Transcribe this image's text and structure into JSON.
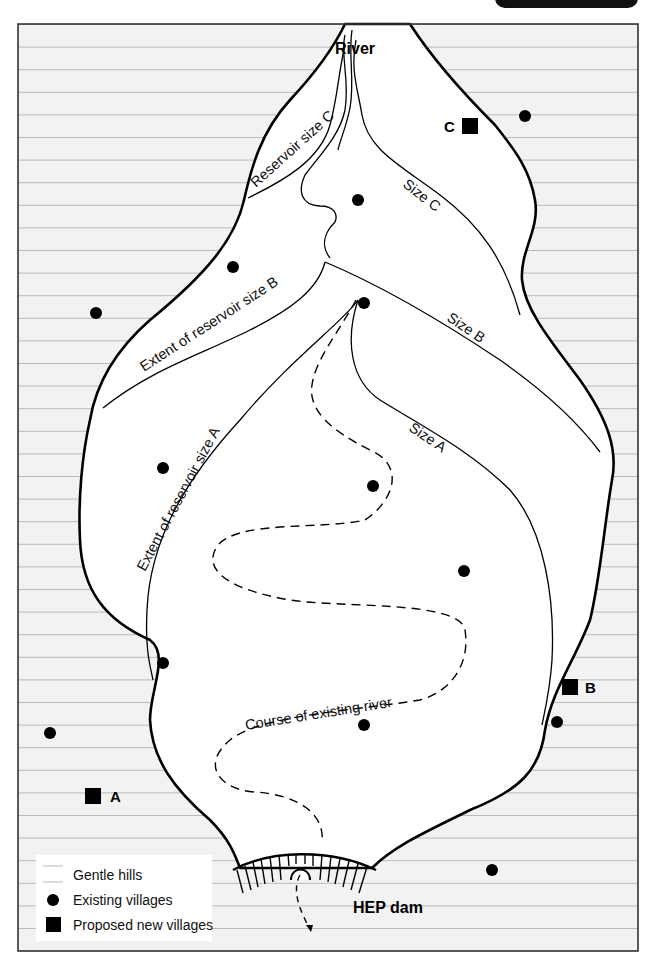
{
  "header_tab": {
    "text": ""
  },
  "map": {
    "labels": {
      "river": "River",
      "reservoir_size_c": "Reservoir size C",
      "size_c": "Size C",
      "extent_size_b": "Extent of reservoir size B",
      "size_b": "Size B",
      "extent_size_a": "Extent of reservoir size A",
      "size_a": "Size A",
      "course_existing_river": "Course of existing river",
      "hep_dam": "HEP dam"
    },
    "proposed_villages": [
      {
        "label": "A",
        "x": 93,
        "y": 796
      },
      {
        "label": "B",
        "x": 570,
        "y": 687
      },
      {
        "label": "C",
        "x": 470,
        "y": 126
      }
    ],
    "existing_villages": [
      {
        "x": 525,
        "y": 116
      },
      {
        "x": 358,
        "y": 200
      },
      {
        "x": 233,
        "y": 267
      },
      {
        "x": 96,
        "y": 313
      },
      {
        "x": 364,
        "y": 303
      },
      {
        "x": 163,
        "y": 468
      },
      {
        "x": 373,
        "y": 486
      },
      {
        "x": 464,
        "y": 571
      },
      {
        "x": 163,
        "y": 663
      },
      {
        "x": 364,
        "y": 725
      },
      {
        "x": 557,
        "y": 722
      },
      {
        "x": 50,
        "y": 733
      },
      {
        "x": 492,
        "y": 870
      }
    ],
    "colors": {
      "hills_fill": "#f2f2f2",
      "hills_line": "#b9b9b9",
      "outline": "#000000",
      "valley_fill": "#ffffff"
    }
  },
  "legend": {
    "items": [
      {
        "symbol": "gentle-hills",
        "label": "Gentle hills"
      },
      {
        "symbol": "existing-village",
        "label": "Existing villages"
      },
      {
        "symbol": "proposed-village",
        "label": "Proposed new villages"
      }
    ]
  }
}
